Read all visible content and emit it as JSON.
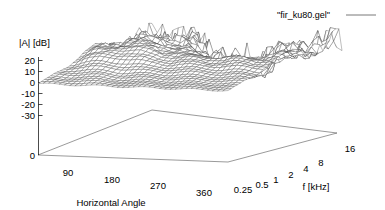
{
  "plot": {
    "background_color": "#ffffff",
    "line_color": "#444444",
    "text_color": "#000000",
    "key": {
      "label": "\"fir_ku80.gel\"",
      "sample_line_color": "#555555",
      "position": "top-right"
    },
    "zaxis": {
      "label": "|A| [dB]",
      "ticks": [
        "20",
        "10",
        "0",
        "-10",
        "-20",
        "-30"
      ],
      "tick_values": [
        20,
        10,
        0,
        -10,
        -20,
        -30
      ],
      "base_tick": "0",
      "range": [
        -30,
        20
      ]
    },
    "xaxis": {
      "label": "Horizontal Angle",
      "ticks": [
        "0",
        "90",
        "180",
        "270",
        "360"
      ],
      "tick_values": [
        0,
        90,
        180,
        270,
        360
      ],
      "range": [
        0,
        360
      ]
    },
    "yaxis": {
      "label": "f [kHz]",
      "ticks": [
        "0.25",
        "0.5",
        "1",
        "2",
        "4",
        "8",
        "16"
      ],
      "tick_values": [
        0.25,
        0.5,
        1,
        2,
        4,
        8,
        16
      ],
      "scale": "log",
      "range": [
        0.25,
        16
      ]
    }
  },
  "chart_data": {
    "type": "surface3d",
    "title": "",
    "series_name": "\"fir_ku80.gel\"",
    "xlabel": "Horizontal Angle",
    "ylabel": "f [kHz]",
    "zlabel": "|A| [dB]",
    "xlim": [
      0,
      360
    ],
    "ylim": [
      0.25,
      16
    ],
    "zlim": [
      -30,
      20
    ],
    "y_scale": "log",
    "grid": false,
    "style": "wireframe-hidden3d",
    "legend_position": "top-right",
    "x": [
      0,
      30,
      60,
      90,
      120,
      150,
      180,
      210,
      240,
      270,
      300,
      330,
      360
    ],
    "y": [
      0.25,
      0.354,
      0.5,
      0.707,
      1,
      1.414,
      2,
      2.828,
      4,
      5.657,
      8,
      11.314,
      16
    ],
    "z": [
      [
        -1,
        -1,
        -1,
        -1,
        -1,
        -1,
        -1,
        -1,
        -1,
        -1,
        -1,
        -1,
        -1
      ],
      [
        0,
        0,
        1,
        1,
        0,
        0,
        0,
        0,
        0,
        0,
        0,
        0,
        0
      ],
      [
        2,
        3,
        3,
        3,
        2,
        2,
        2,
        2,
        2,
        2,
        2,
        2,
        2
      ],
      [
        4,
        6,
        7,
        7,
        6,
        5,
        5,
        5,
        5,
        5,
        4,
        4,
        4
      ],
      [
        8,
        11,
        13,
        13,
        11,
        9,
        8,
        8,
        8,
        8,
        8,
        8,
        8
      ],
      [
        11,
        14,
        16,
        16,
        14,
        12,
        10,
        10,
        10,
        10,
        10,
        10,
        11
      ],
      [
        12,
        15,
        17,
        17,
        15,
        12,
        9,
        7,
        6,
        6,
        8,
        10,
        12
      ],
      [
        10,
        13,
        15,
        16,
        13,
        9,
        4,
        0,
        -3,
        -2,
        2,
        6,
        10
      ],
      [
        8,
        11,
        13,
        14,
        10,
        4,
        -4,
        -10,
        -14,
        -10,
        -3,
        3,
        8
      ],
      [
        6,
        9,
        11,
        11,
        6,
        -2,
        -11,
        -18,
        -20,
        -14,
        -5,
        2,
        6
      ],
      [
        5,
        7,
        8,
        7,
        1,
        -8,
        -16,
        -22,
        -18,
        -12,
        -3,
        3,
        5
      ],
      [
        4,
        5,
        5,
        3,
        -3,
        -12,
        -18,
        -16,
        -12,
        -6,
        0,
        4,
        4
      ],
      [
        3,
        4,
        3,
        0,
        -6,
        -14,
        -14,
        -10,
        -6,
        -2,
        2,
        5,
        3
      ]
    ]
  }
}
